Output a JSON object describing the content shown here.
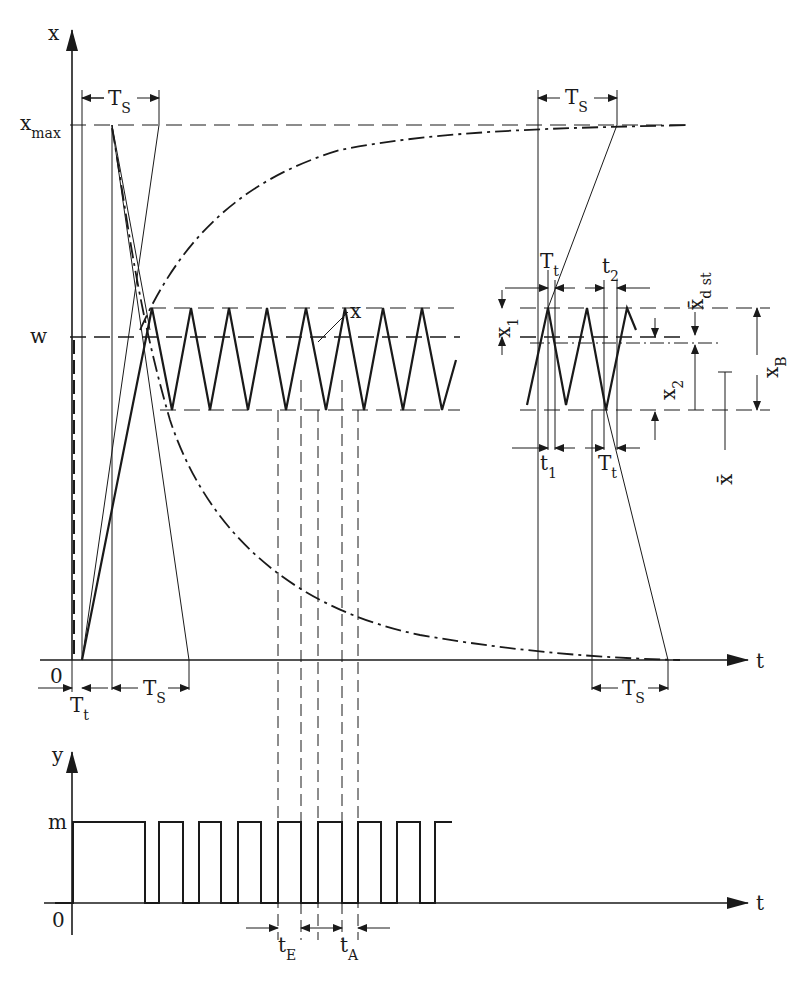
{
  "diagram": {
    "type": "two-position controller response diagram",
    "upper_plot": {
      "y_axis_label": "x",
      "x_axis_label": "t",
      "origin_label": "0",
      "levels": {
        "x_max": {
          "main": "x",
          "sub": "max"
        },
        "w": "w"
      },
      "curve_label": "x",
      "annotations": {
        "Ts_top_left": {
          "main": "T",
          "sub": "S"
        },
        "Ts_top_right": {
          "main": "T",
          "sub": "S"
        },
        "Ts_bottom_left": {
          "main": "T",
          "sub": "S"
        },
        "Ts_bottom_right": {
          "main": "T",
          "sub": "S"
        },
        "Tt_bottom": {
          "main": "T",
          "sub": "t"
        },
        "Tt_right": {
          "main": "T",
          "sub": "t"
        },
        "Tt_right_lower": {
          "main": "T",
          "sub": "t"
        },
        "t1": {
          "main": "t",
          "sub": "1"
        },
        "t2": {
          "main": "t",
          "sub": "2"
        },
        "x1": {
          "main": "x",
          "sub": "1"
        },
        "x2": {
          "main": "x",
          "sub": "2"
        },
        "xB": {
          "main": "x",
          "sub": "B"
        },
        "xdst": {
          "main": "x̄",
          "sub": "d st"
        },
        "xbar": "x̄"
      }
    },
    "lower_plot": {
      "y_axis_label": "y",
      "x_axis_label": "t",
      "origin_label": "0",
      "level_label": "m",
      "annotations": {
        "tE": {
          "main": "t",
          "sub": "E"
        },
        "tA": {
          "main": "t",
          "sub": "A"
        }
      }
    }
  }
}
